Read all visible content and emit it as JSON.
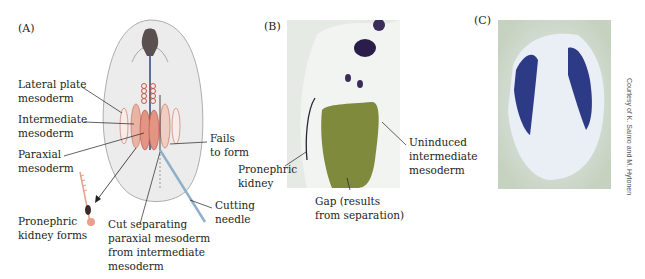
{
  "panels": {
    "a": {
      "letter": "(A)",
      "labels": {
        "lateral_plate": "Lateral plate\nmesoderm",
        "intermediate": "Intermediate\nmesoderm",
        "paraxial": "Paraxial\nmesoderm",
        "fails": "Fails\nto form",
        "kidney_forms": "Pronephric\nkidney forms",
        "cut": "Cut separating\nparaxial mesoderm\nfrom intermediate\nmesoderm",
        "needle": "Cutting\nneedle"
      }
    },
    "b": {
      "letter": "(B)",
      "labels": {
        "pronephric_kidney": "Pronephric\nkidney",
        "uninduced": "Uninduced\nintermediate\nmesoderm",
        "gap": "Gap (results\nfrom separation)"
      }
    },
    "c": {
      "letter": "(C)",
      "credit": "Courtesy of K. Sainio and M. Hytonen"
    }
  },
  "colors": {
    "embryo_fill": "#ececec",
    "mesoderm_pink": "#e8a08c",
    "mesoderm_light": "#f3d2c6",
    "stain_purple": "#2a1d4a",
    "gap_green": "#7f8a3c",
    "photo_c_bg": "#c9d4c4",
    "stain_blue": "#2d3a86"
  }
}
